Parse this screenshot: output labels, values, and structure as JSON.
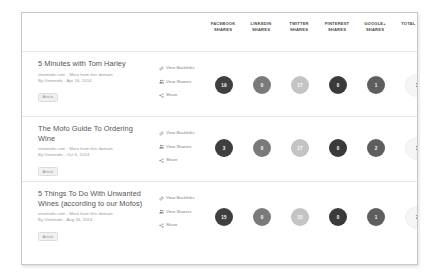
{
  "table": {
    "columns": [
      {
        "id": "facebook",
        "line1": "FACEBOOK",
        "line2": "SHARES"
      },
      {
        "id": "linkedin",
        "line1": "LINKEDIN",
        "line2": "SHARES"
      },
      {
        "id": "twitter",
        "line1": "TWITTER",
        "line2": "SHARES"
      },
      {
        "id": "pinterest",
        "line1": "PINTEREST",
        "line2": "SHARES"
      },
      {
        "id": "googleplus",
        "line1": "GOOGLE+",
        "line2": "SHARES"
      },
      {
        "id": "total",
        "line1": "TOTAL SHARES",
        "line2": ""
      }
    ],
    "sort": {
      "column": "total",
      "direction": "descending",
      "caret": "▼"
    }
  },
  "actions": {
    "view_backlinks": "View Backlinks",
    "view_sharers": "View Sharers",
    "share": "Share"
  },
  "rows": [
    {
      "title": "5 Minutes with Tom Harley",
      "domain_line": "vinomofo.com - More from this domain",
      "byline": "By Vinomofo - Apr 16, 2014",
      "tag": "Article",
      "shares": {
        "facebook": "19",
        "linkedin": "0",
        "twitter": "17",
        "pinterest": "0",
        "googleplus": "1",
        "total": "37"
      },
      "colors": {
        "facebook": "#3f3f3f",
        "linkedin": "#7a7a7a",
        "twitter": "#c4c4c4",
        "pinterest": "#3a3a3a",
        "googleplus": "#5e5e5e",
        "total": "#f5f5f5"
      }
    },
    {
      "title": "The Mofo Guide To Ordering Wine",
      "domain_line": "vinomofo.com - More from this domain",
      "byline": "By Vinomofo - Oct 6, 2014",
      "tag": "Article",
      "shares": {
        "facebook": "3",
        "linkedin": "0",
        "twitter": "27",
        "pinterest": "0",
        "googleplus": "2",
        "total": "32"
      },
      "colors": {
        "facebook": "#3f3f3f",
        "linkedin": "#7a7a7a",
        "twitter": "#c4c4c4",
        "pinterest": "#3a3a3a",
        "googleplus": "#5e5e5e",
        "total": "#f5f5f5"
      }
    },
    {
      "title": "5 Things To Do With Unwanted Wines (according to our Mofos)",
      "domain_line": "vinomofo.com - More from this domain",
      "byline": "By Vinomofo - Aug 26, 2014",
      "tag": "Article",
      "shares": {
        "facebook": "15",
        "linkedin": "0",
        "twitter": "15",
        "pinterest": "0",
        "googleplus": "1",
        "total": "31"
      },
      "colors": {
        "facebook": "#3f3f3f",
        "linkedin": "#7a7a7a",
        "twitter": "#c4c4c4",
        "pinterest": "#3a3a3a",
        "googleplus": "#5e5e5e",
        "total": "#f5f5f5"
      }
    }
  ],
  "chart_data": {
    "type": "table",
    "categories": [
      "Facebook Shares",
      "LinkedIn Shares",
      "Twitter Shares",
      "Pinterest Shares",
      "Google+ Shares",
      "Total Shares"
    ],
    "rows": [
      {
        "label": "5 Minutes with Tom Harley",
        "values": [
          19,
          0,
          17,
          0,
          1,
          37
        ]
      },
      {
        "label": "The Mofo Guide To Ordering Wine",
        "values": [
          3,
          0,
          27,
          0,
          2,
          32
        ]
      },
      {
        "label": "5 Things To Do With Unwanted Wines (according to our Mofos)",
        "values": [
          15,
          0,
          15,
          0,
          1,
          31
        ]
      }
    ],
    "sorted_by": "Total Shares",
    "sort_direction": "descending"
  }
}
